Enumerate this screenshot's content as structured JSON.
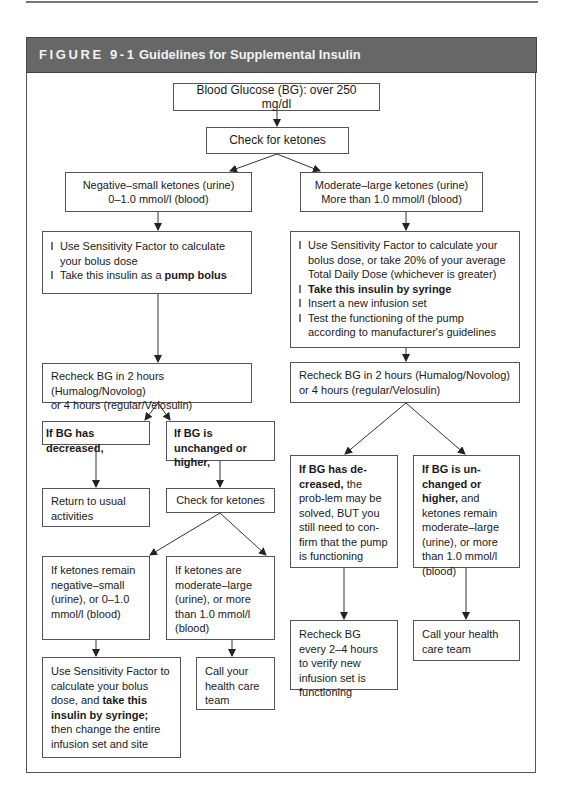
{
  "figure": {
    "number": "FIGURE 9-1",
    "title": "Guidelines for Supplemental Insulin"
  },
  "nodes": {
    "start": "Blood Glucose (BG): over 250 mg/dl",
    "check_ketones": "Check for ketones",
    "neg_small": {
      "line1": "Negative–small ketones (urine)",
      "line2": "0–1.0 mmol/l (blood)"
    },
    "mod_large": {
      "line1": "Moderate–large ketones (urine)",
      "line2": "More than 1.0 mmol/l (blood)"
    },
    "left_action": {
      "bullet1": "Use Sensitivity Factor to calculate your bolus dose",
      "bullet2_prefix": "Take this insulin as a ",
      "bullet2_bold": "pump bolus"
    },
    "right_action": {
      "bullet1": "Use Sensitivity Factor to calculate your bolus dose, or take 20% of your average Total Daily Dose (whichever is greater)",
      "bullet2_bold": "Take this insulin by syringe",
      "bullet3": "Insert a new infusion set",
      "bullet4": "Test the functioning of the pump according to manufacturer's guidelines"
    },
    "left_recheck": {
      "line1": "Recheck BG in 2 hours (Humalog/Novolog)",
      "line2": "or 4 hours (regular/Velosulin)"
    },
    "right_recheck": {
      "line1": "Recheck BG in 2 hours (Humalog/Novolog)",
      "line2": "or 4 hours (regular/Velosulin)"
    },
    "left_decreased": "If BG has decreased,",
    "left_unchanged": "If  BG is unchanged or higher,",
    "return_usual": "Return to usual activities",
    "check_ketones_2": "Check for ketones",
    "ketones_neg_small": "If ketones remain negative–small (urine), or 0–1.0 mmol/l (blood)",
    "ketones_mod_large": "If ketones are moderate–large (urine), or more than 1.0 mmol/l (blood)",
    "use_sf_syringe": {
      "prefix": "Use Sensitivity Factor to calculate your bolus dose, and ",
      "bold": "take this insulin by syringe;",
      "suffix": " then change the entire infusion set and site"
    },
    "call_team_left": "Call your health care team",
    "right_decreased": {
      "bold": "If BG has de-creased,",
      "rest": " the prob-lem may be solved, BUT you still need to con-firm that the pump is functioning"
    },
    "right_unchanged": {
      "bold": "If BG is un-changed or higher,",
      "rest": " and ketones remain moderate–large (urine), or more than 1.0 mmol/l (blood)"
    },
    "recheck_every": "Recheck BG every 2–4 hours to verify new infusion set is functioning",
    "call_team_right": "Call your health care team"
  }
}
